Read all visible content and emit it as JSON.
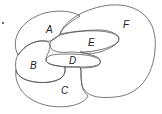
{
  "diagram": {
    "type": "planar-map-regions",
    "regions": [
      {
        "id": "A",
        "label": "A",
        "x": 48,
        "y": 32
      },
      {
        "id": "B",
        "label": "B",
        "x": 32,
        "y": 69
      },
      {
        "id": "C",
        "label": "C",
        "x": 63,
        "y": 94
      },
      {
        "id": "D",
        "label": "D",
        "x": 70,
        "y": 64
      },
      {
        "id": "E",
        "label": "E",
        "x": 89,
        "y": 45
      },
      {
        "id": "F",
        "label": "F",
        "x": 123,
        "y": 28
      }
    ],
    "marker": "."
  }
}
